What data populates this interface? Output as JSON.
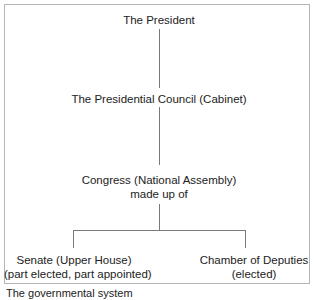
{
  "diagram": {
    "type": "hierarchy",
    "nodes": {
      "president": {
        "line1": "The President"
      },
      "council": {
        "line1": "The Presidential Council (Cabinet)"
      },
      "congress": {
        "line1": "Congress (National Assembly)",
        "line2": "made up of"
      },
      "senate": {
        "line1": "Senate (Upper House)",
        "line2": "(part elected, part appointed)"
      },
      "deputies": {
        "line1": "Chamber of Deputies",
        "line2": "(elected)"
      }
    },
    "edges": [
      [
        "president",
        "council"
      ],
      [
        "council",
        "congress"
      ],
      [
        "congress",
        "senate"
      ],
      [
        "congress",
        "deputies"
      ]
    ],
    "line_color": "#7a7a7a",
    "border_color": "#b5b5b5"
  },
  "caption": "The governmental system"
}
